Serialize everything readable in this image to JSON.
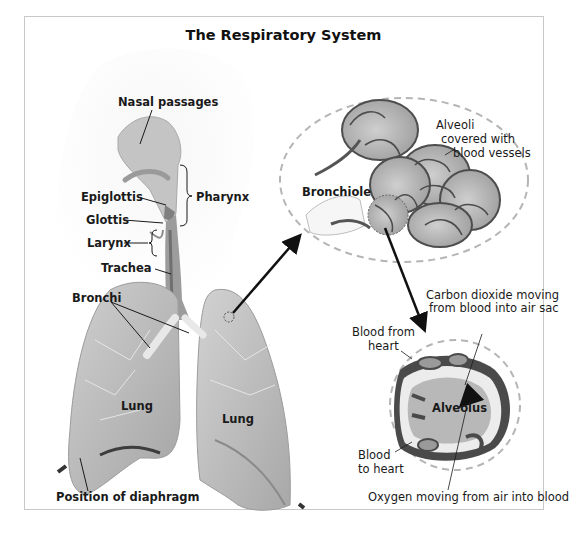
{
  "title": "The Respiratory System",
  "labels": {
    "nasal_passages": "Nasal passages",
    "pharynx": "Pharynx",
    "epiglottis": "Epiglottis",
    "glottis": "Glottis",
    "larynx": "Larynx",
    "trachea": "Trachea",
    "bronchi": "Bronchi",
    "lung_left": "Lung",
    "lung_right": "Lung",
    "diaphragm": "Position of diaphragm",
    "bronchiole": "Bronchiole",
    "alveoli_line1": "Alveoli",
    "alveoli_line2": "covered with",
    "alveoli_line3": "blood vessels",
    "co2_line1": "Carbon dioxide moving",
    "co2_line2": "from blood into air sac",
    "blood_from_line1": "Blood from",
    "blood_from_line2": "heart",
    "alveolus": "Alveolus",
    "blood_to_line1": "Blood",
    "blood_to_line2": "to heart",
    "oxygen": "Oxygen moving from air into blood"
  },
  "colors": {
    "frame": "#c8c8c8",
    "tissue": "#b9b9b9",
    "tissue_dark": "#8f8f8f",
    "vessel": "#555555",
    "dashed": "#b5b5b5",
    "arrow": "#111111"
  }
}
